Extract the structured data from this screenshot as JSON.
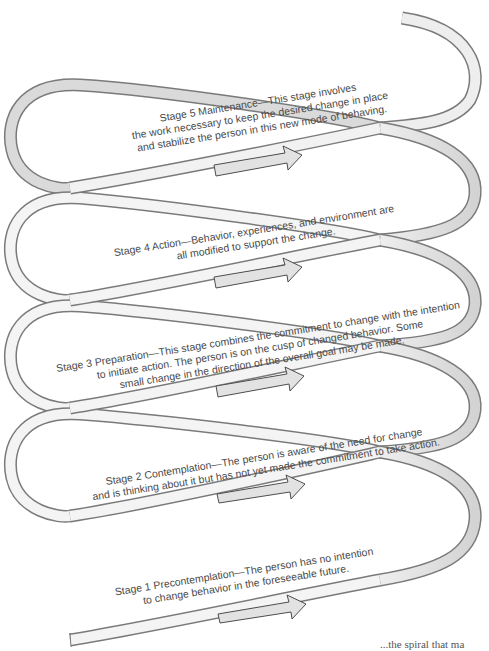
{
  "diagram": {
    "colors": {
      "ribbon_fill": "#eeeeee",
      "ribbon_shade": "#d6d6d6",
      "ribbon_stroke": "#7a7a7a",
      "arrow_fill": "#e4e4e4",
      "arrow_stroke": "#555555",
      "text": "#4a4a4a"
    },
    "stages": [
      {
        "number": 5,
        "name": "Maintenance",
        "lines": [
          "Stage 5 Maintenance—This stage involves",
          "the work necessary to keep the desired change in place",
          "and stabilize the person in this new mode of behaving."
        ]
      },
      {
        "number": 4,
        "name": "Action",
        "lines": [
          "Stage 4 Action—Behavior, experiences, and environment are",
          "all modified to support the change."
        ]
      },
      {
        "number": 3,
        "name": "Preparation",
        "lines": [
          "Stage 3 Preparation—This stage combines the commitment to change with the intention",
          "to initiate action. The person is on the cusp of changed behavior. Some",
          "small change in the direction of the overall goal may be made."
        ]
      },
      {
        "number": 2,
        "name": "Contemplation",
        "lines": [
          "Stage 2 Contemplation—The person is aware of the need for change",
          "and is thinking about it but has not yet made the commitment to take action."
        ]
      },
      {
        "number": 1,
        "name": "Precontemplation",
        "lines": [
          "Stage 1 Precontemplation—The person has no intention",
          "to change behavior in the foreseeable future."
        ]
      }
    ],
    "footer_fragment": "...the spiral that ma"
  }
}
